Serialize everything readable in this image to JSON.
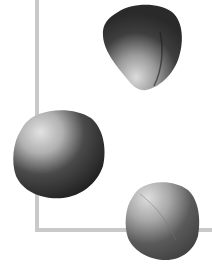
{
  "scene": {
    "description": "Three grayscale rose petals scattered over a light gray L-shaped frame line on white background",
    "background": "#ffffff",
    "frame_color": "#c9c9c9",
    "petals": [
      {
        "id": "petal-top",
        "dark": "#2e2e2e",
        "light": "#d8d8d8"
      },
      {
        "id": "petal-left",
        "dark": "#262626",
        "light": "#e0e0e0"
      },
      {
        "id": "petal-bottom",
        "dark": "#4a4a4a",
        "light": "#dcdcdc"
      }
    ]
  }
}
